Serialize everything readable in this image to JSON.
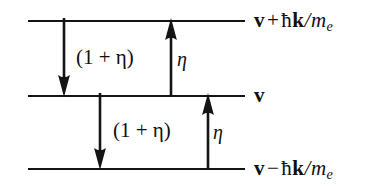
{
  "figure": {
    "type": "energy-level-transition-diagram",
    "background_color": "#ffffff",
    "line_color": "#141414",
    "levels": [
      {
        "id": "upper",
        "y": 20,
        "x_start": 28,
        "x_end": 245,
        "label_parts": {
          "vector": "v",
          "operator": "+",
          "hbar": "ħ",
          "wavevector": "k",
          "slash": "/",
          "mass": "m",
          "mass_subscript": "e"
        },
        "label_text": "v + ħk/m_e"
      },
      {
        "id": "middle",
        "y": 95,
        "x_start": 28,
        "x_end": 245,
        "label_parts": {
          "vector": "v",
          "operator": "",
          "hbar": "",
          "wavevector": "",
          "slash": "",
          "mass": "",
          "mass_subscript": ""
        },
        "label_text": "v"
      },
      {
        "id": "lower",
        "y": 168,
        "x_start": 28,
        "x_end": 245,
        "label_parts": {
          "vector": "v",
          "operator": "−",
          "hbar": "ħ",
          "wavevector": "k",
          "slash": "/",
          "mass": "m",
          "mass_subscript": "e"
        },
        "label_text": "v − ħk/m_e"
      }
    ],
    "transitions": [
      {
        "id": "upper-down",
        "direction": "down",
        "x": 64,
        "y_from": 20,
        "y_to": 95,
        "rate_label": "(1 + η)",
        "label_x": 76,
        "label_y": 47
      },
      {
        "id": "upper-up",
        "direction": "up",
        "x": 171,
        "y_from": 95,
        "y_to": 20,
        "rate_label": "η",
        "label_x": 177,
        "label_y": 49
      },
      {
        "id": "lower-down",
        "direction": "down",
        "x": 100,
        "y_from": 95,
        "y_to": 168,
        "rate_label": "(1 + η)",
        "label_x": 113,
        "label_y": 120
      },
      {
        "id": "lower-up",
        "direction": "up",
        "x": 208,
        "y_from": 168,
        "y_to": 95,
        "rate_label": "η",
        "label_x": 213,
        "label_y": 122
      }
    ],
    "symbols": {
      "eta": "η",
      "hbar": "ħ",
      "plus": "+",
      "minus": "−",
      "one": "1",
      "paren_open": "(",
      "paren_close": ")"
    }
  }
}
